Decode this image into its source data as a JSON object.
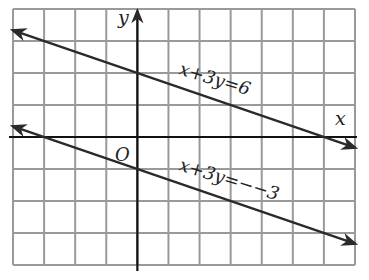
{
  "chart_data": {
    "type": "line",
    "title": "",
    "xlabel": "x",
    "ylabel": "y",
    "origin_label": "O",
    "xlim": [
      -4,
      7
    ],
    "ylim": [
      -4,
      4
    ],
    "grid": true,
    "grid_step": 1,
    "series": [
      {
        "name": "x+3y=6",
        "equation": "x + 3y = 6",
        "label": "x+3y=6",
        "points": [
          [
            -4,
            3.333
          ],
          [
            0,
            2
          ],
          [
            6,
            0
          ],
          [
            7,
            -0.333
          ]
        ]
      },
      {
        "name": "x+3y=-3",
        "equation": "x + 3y = -3",
        "label": "x+3y=−−3",
        "points": [
          [
            -4,
            0.333
          ],
          [
            -3,
            0
          ],
          [
            0,
            -1
          ],
          [
            7,
            -3.333
          ]
        ]
      }
    ]
  },
  "labels": {
    "x_axis": "x",
    "y_axis": "y",
    "origin": "O",
    "line1": "x+3y=6",
    "line2": "x+3y=−−3"
  },
  "colors": {
    "grid": "#9a9a9a",
    "axis": "#111111",
    "line": "#2a2a2a"
  }
}
